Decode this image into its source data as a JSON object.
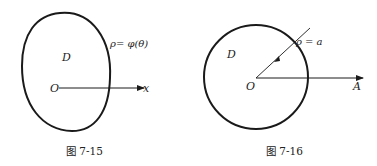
{
  "figures": [
    {
      "id": "fig-7-15",
      "caption": "图 7-15",
      "region_label": "D",
      "origin_label": "O",
      "axis_label": "x",
      "curve_label": "ρ= φ(θ)"
    },
    {
      "id": "fig-7-16",
      "caption": "图 7-16",
      "region_label": "D",
      "origin_label": "O",
      "axis_label": "A",
      "curve_label": "ρ = a"
    }
  ],
  "colors": {
    "stroke": "#1a1a1a",
    "text": "#222222",
    "background": "#ffffff"
  }
}
